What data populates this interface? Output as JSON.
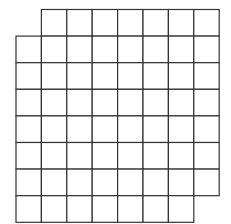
{
  "diagram": {
    "title": "",
    "type": "mutilated-chessboard-grid",
    "rows": 8,
    "cols": 8,
    "removed_cells": [
      {
        "row": 0,
        "col": 0
      },
      {
        "row": 7,
        "col": 7
      }
    ],
    "origin_x": 16,
    "origin_y": 9.5,
    "cell_width": 25.4,
    "cell_height": 26.6,
    "line_color": "#333333",
    "fill_color": "#ffffff",
    "line_width": 1.2
  }
}
